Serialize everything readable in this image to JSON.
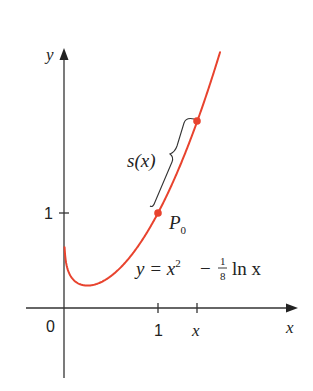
{
  "chart_data": {
    "type": "line",
    "title": "",
    "xlabel": "x",
    "ylabel": "y",
    "function": "y = x^2 - (1/8) ln x",
    "series": [
      {
        "name": "y = x^2 - 1/8 ln x",
        "color": "#e8432e",
        "x": [
          0.01,
          0.05,
          0.1,
          0.25,
          0.5,
          0.75,
          1.0,
          1.25,
          1.42,
          1.66
        ],
        "values": [
          0.576,
          0.377,
          0.298,
          0.236,
          0.337,
          0.598,
          1.0,
          1.535,
          1.972,
          2.692
        ]
      }
    ],
    "points": [
      {
        "label": "P0",
        "x": 1,
        "y": 1
      },
      {
        "label": "",
        "x": 1.42,
        "y": 1.97
      }
    ],
    "x_ticks": [
      "0",
      "1",
      "x"
    ],
    "y_ticks": [
      "1"
    ],
    "annotations": [
      "s(x)",
      "P0",
      "y = x² − 1/8 ln x"
    ],
    "xlim": [
      -0.4,
      2.5
    ],
    "ylim": [
      -0.74,
      2.7
    ],
    "grid": false,
    "legend": "none"
  },
  "labels": {
    "y_axis": "y",
    "x_axis": "x",
    "origin": "0",
    "x_tick_1": "1",
    "x_tick_x": "x",
    "y_tick_1": "1",
    "arc_length": "s(x)",
    "point_P": "P",
    "point_sub": "0",
    "eq_y": "y = x",
    "eq_sup": "2",
    "eq_minus": "−",
    "eq_num": "1",
    "eq_den": "8",
    "eq_ln": "ln x"
  },
  "colors": {
    "curve": "#e8432e",
    "axis": "#333333",
    "text": "#222222"
  }
}
